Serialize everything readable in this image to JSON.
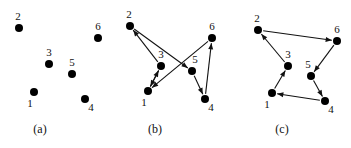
{
  "figure": {
    "width": 351,
    "height": 148,
    "background_color": "#ffffff",
    "ink_color": "#111111",
    "node_radius": 4
  },
  "panels": [
    {
      "id": "panel-a",
      "caption": "(a)",
      "caption_x": 40,
      "caption_y": 122,
      "description": "six labelled points, no edges",
      "nodes": [
        {
          "id": "1",
          "label": "1",
          "x": 34,
          "y": 92,
          "label_dx": -4,
          "label_dy": 15
        },
        {
          "id": "2",
          "label": "2",
          "x": 19,
          "y": 28,
          "label_dx": -1,
          "label_dy": -8
        },
        {
          "id": "3",
          "label": "3",
          "x": 49,
          "y": 64,
          "label_dx": 0,
          "label_dy": -8
        },
        {
          "id": "4",
          "label": "4",
          "x": 85,
          "y": 99,
          "label_dx": 6,
          "label_dy": 12
        },
        {
          "id": "5",
          "label": "5",
          "x": 72,
          "y": 74,
          "label_dx": 0,
          "label_dy": -8
        },
        {
          "id": "6",
          "label": "6",
          "x": 98,
          "y": 38,
          "label_dx": 0,
          "label_dy": -8
        }
      ],
      "edges": []
    },
    {
      "id": "panel-b",
      "caption": "(b)",
      "caption_x": 155,
      "caption_y": 122,
      "description": "directed graph, crossing edges",
      "nodes": [
        {
          "id": "1",
          "label": "1",
          "x": 148,
          "y": 91,
          "label_dx": -4,
          "label_dy": 15
        },
        {
          "id": "2",
          "label": "2",
          "x": 130,
          "y": 26,
          "label_dx": -1,
          "label_dy": -8
        },
        {
          "id": "3",
          "label": "3",
          "x": 161,
          "y": 66,
          "label_dx": 0,
          "label_dy": -8
        },
        {
          "id": "4",
          "label": "4",
          "x": 205,
          "y": 99,
          "label_dx": 6,
          "label_dy": 12
        },
        {
          "id": "5",
          "label": "5",
          "x": 192,
          "y": 71,
          "label_dx": 3,
          "label_dy": -8
        },
        {
          "id": "6",
          "label": "6",
          "x": 212,
          "y": 38,
          "label_dx": 0,
          "label_dy": -8
        }
      ],
      "edges": [
        {
          "from": "2",
          "to": "5"
        },
        {
          "from": "3",
          "to": "2"
        },
        {
          "from": "1",
          "to": "3"
        },
        {
          "from": "3",
          "to": "1"
        },
        {
          "from": "6",
          "to": "1"
        },
        {
          "from": "5",
          "to": "4"
        },
        {
          "from": "4",
          "to": "6"
        }
      ]
    },
    {
      "id": "panel-c",
      "caption": "(c)",
      "caption_x": 282,
      "caption_y": 122,
      "description": "directed cycle through all six points",
      "nodes": [
        {
          "id": "1",
          "label": "1",
          "x": 272,
          "y": 93,
          "label_dx": -5,
          "label_dy": 15
        },
        {
          "id": "2",
          "label": "2",
          "x": 258,
          "y": 30,
          "label_dx": -1,
          "label_dy": -8
        },
        {
          "id": "3",
          "label": "3",
          "x": 288,
          "y": 66,
          "label_dx": 0,
          "label_dy": -8
        },
        {
          "id": "4",
          "label": "4",
          "x": 325,
          "y": 101,
          "label_dx": 6,
          "label_dy": 12
        },
        {
          "id": "5",
          "label": "5",
          "x": 311,
          "y": 76,
          "label_dx": -3,
          "label_dy": -8
        },
        {
          "id": "6",
          "label": "6",
          "x": 337,
          "y": 41,
          "label_dx": 0,
          "label_dy": -8
        }
      ],
      "edges": [
        {
          "from": "2",
          "to": "6"
        },
        {
          "from": "6",
          "to": "5"
        },
        {
          "from": "5",
          "to": "4"
        },
        {
          "from": "4",
          "to": "1"
        },
        {
          "from": "1",
          "to": "3"
        },
        {
          "from": "3",
          "to": "2"
        }
      ]
    }
  ]
}
